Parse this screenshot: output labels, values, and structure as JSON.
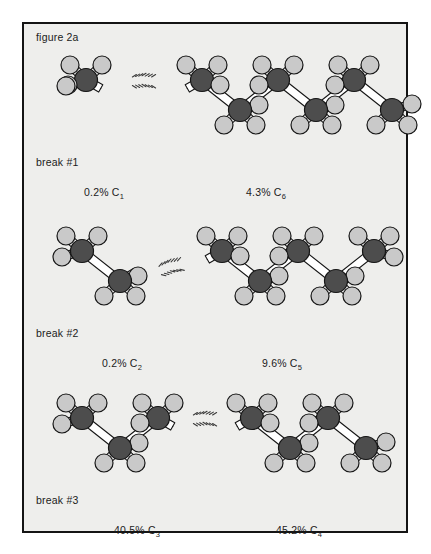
{
  "figure": {
    "label": "figure 2a",
    "background_color": "#eeeeec",
    "border_color": "#141414",
    "page_background": "#ffffff"
  },
  "atoms": {
    "carbon_color": "#4d4d4d",
    "carbon_outline": "#161616",
    "hydrogen_color": "#c9c9c9",
    "hydrogen_outline": "#161616",
    "bond_color": "#ffffff",
    "bond_outline": "#161616",
    "break_dash_color": "#3a3a3a"
  },
  "panels": [
    {
      "break_label": "break #1",
      "left": {
        "yield": "0.2%",
        "fragment": "C",
        "carbon_number": "1",
        "carbon_count": 1
      },
      "right": {
        "yield": "4.3%",
        "fragment": "C",
        "carbon_number": "6",
        "carbon_count": 6
      }
    },
    {
      "break_label": "break #2",
      "left": {
        "yield": "0.2%",
        "fragment": "C",
        "carbon_number": "2",
        "carbon_count": 2
      },
      "right": {
        "yield": "9.6%",
        "fragment": "C",
        "carbon_number": "5",
        "carbon_count": 5
      }
    },
    {
      "break_label": "break #3",
      "left": {
        "yield": "40.5%",
        "fragment": "C",
        "carbon_number": "3",
        "carbon_count": 3
      },
      "right": {
        "yield": "45.2%",
        "fragment": "C",
        "carbon_number": "4",
        "carbon_count": 4
      }
    }
  ]
}
